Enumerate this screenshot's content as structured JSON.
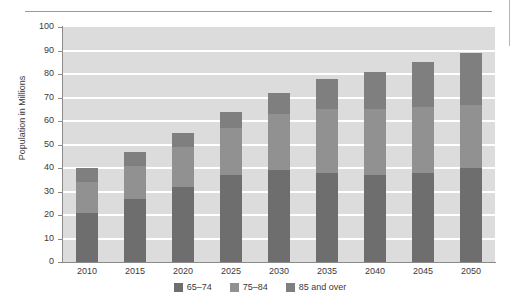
{
  "chart_data": {
    "type": "bar",
    "stacked": true,
    "title": "",
    "xlabel": "",
    "ylabel": "Population in Millions",
    "ylim": [
      0,
      100
    ],
    "ytick_step": 10,
    "yticks": [
      "100",
      "90",
      "80",
      "70",
      "60",
      "50",
      "40",
      "30",
      "20",
      "10",
      "0"
    ],
    "grid": true,
    "legend_position": "bottom-center",
    "categories": [
      "2010",
      "2015",
      "2020",
      "2025",
      "2030",
      "2035",
      "2040",
      "2045",
      "2050"
    ],
    "series": [
      {
        "name": "65–74",
        "color": "#6e6e6e",
        "values": [
          21,
          27,
          32,
          37,
          39,
          38,
          37,
          38,
          40
        ]
      },
      {
        "name": "75–84",
        "color": "#919191",
        "values": [
          13,
          14,
          17,
          20,
          24,
          27,
          28,
          28,
          27
        ]
      },
      {
        "name": "85 and over",
        "color": "#7f7f7f",
        "values": [
          6,
          6,
          6,
          7,
          9,
          13,
          16,
          19,
          22
        ]
      }
    ],
    "totals": [
      40,
      47,
      55,
      64,
      72,
      78,
      81,
      85,
      89
    ],
    "plot_background": "#dcdcdc",
    "gridline_color": "#ffffff"
  },
  "legend": {
    "items": [
      {
        "label": "65–74"
      },
      {
        "label": "75–84"
      },
      {
        "label": "85 and over"
      }
    ]
  }
}
